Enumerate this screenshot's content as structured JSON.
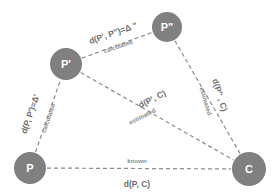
{
  "diagram": {
    "type": "graph",
    "title": "",
    "background_color": "#ffffff",
    "node_color": "#808080",
    "node_text_color": "#ffffff",
    "edge_color": "#8a8a8a",
    "label_color": "#6e6e6e",
    "sublabel_color": "#8c8c8c",
    "nodes": [
      {
        "id": "P",
        "label": "P",
        "cx": 30,
        "cy": 168,
        "r": 16
      },
      {
        "id": "Pp",
        "label": "P'",
        "cx": 66,
        "cy": 64,
        "r": 16
      },
      {
        "id": "Ppp",
        "label": "P\"",
        "cx": 167,
        "cy": 27,
        "r": 15
      },
      {
        "id": "C",
        "label": "C",
        "cx": 249,
        "cy": 169,
        "r": 17
      }
    ],
    "edges": [
      {
        "id": "edge-p-pprime",
        "from": "P",
        "to": "Pp",
        "label": "d(P, P')=Δ'",
        "sublabel": "calculated",
        "label_x": 30,
        "label_y": 114,
        "label_rotate": -71,
        "sublabel_x": 48,
        "sublabel_y": 118,
        "sublabel_rotate": -71
      },
      {
        "id": "edge-pprime-pdprime",
        "from": "Pp",
        "to": "Ppp",
        "label": "d(P', P\")=Δ \"",
        "sublabel": "calculated",
        "label_x": 113,
        "label_y": 33,
        "label_rotate": -19,
        "sublabel_x": 118,
        "sublabel_y": 46,
        "sublabel_rotate": -19
      },
      {
        "id": "edge-pprime-c",
        "from": "Pp",
        "to": "C",
        "label": "d(P', C)",
        "sublabel": "estimated",
        "label_x": 152,
        "label_y": 99,
        "label_rotate": -27,
        "sublabel_x": 142,
        "sublabel_y": 116,
        "sublabel_rotate": -27
      },
      {
        "id": "edge-pdprime-c",
        "from": "Ppp",
        "to": "C",
        "label": "d(P\" , C)",
        "sublabel": "estimated",
        "label_x": 220,
        "label_y": 95,
        "label_rotate": 73,
        "sublabel_x": 206,
        "sublabel_y": 101,
        "sublabel_rotate": 73
      },
      {
        "id": "edge-p-c",
        "from": "P",
        "to": "C",
        "label": "d(P, C)",
        "sublabel": "known",
        "label_x": 137,
        "label_y": 184,
        "label_rotate": 0,
        "sublabel_x": 137,
        "sublabel_y": 160,
        "sublabel_rotate": 0
      }
    ]
  }
}
